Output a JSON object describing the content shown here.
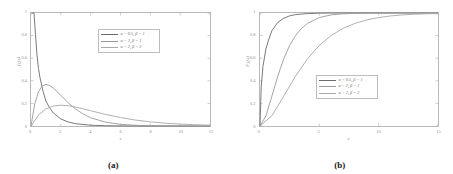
{
  "figure": {
    "panels": [
      {
        "caption": "(a)",
        "ylabel": "f_X(x)",
        "xlabel": "x",
        "legend": [
          {
            "label": "α = 0.5,  β = 1",
            "color": "#6b6b6b"
          },
          {
            "label": "α = 2,  β = 1",
            "color": "#9a9a9a"
          },
          {
            "label": "α = 2,  β = 2",
            "color": "#a8a8a8"
          }
        ]
      },
      {
        "caption": "(b)",
        "ylabel": "F_X(x)",
        "xlabel": "x",
        "legend": [
          {
            "label": "α = 0.5,  β = 1",
            "color": "#6b6b6b"
          },
          {
            "label": "α = 2,  β = 1",
            "color": "#9a9a9a"
          },
          {
            "label": "α = 2,  β = 2",
            "color": "#a8a8a8"
          }
        ]
      }
    ]
  },
  "chart_data": [
    {
      "type": "line",
      "title": "",
      "panel": "(a)",
      "xlabel": "x",
      "ylabel": "f_X(x)",
      "xlim": [
        0,
        12
      ],
      "ylim": [
        0,
        1
      ],
      "xticks": [
        0,
        2,
        4,
        6,
        8,
        10,
        12
      ],
      "xticklabels": [
        "0",
        "2",
        "4",
        "6",
        "8",
        "10",
        "12"
      ],
      "yticks": [
        0,
        0.2,
        0.4,
        0.6,
        0.8,
        1
      ],
      "yticklabels": [
        "0",
        "0.2",
        "0.4",
        "0.6",
        "0.8",
        "1"
      ],
      "grid": false,
      "legend_position": "upper-center",
      "series": [
        {
          "name": "α = 0.5,  β = 1",
          "color": "#6b6b6b",
          "x": [
            0.05,
            0.1,
            0.2,
            0.3,
            0.4,
            0.5,
            0.6,
            0.8,
            1.0,
            1.25,
            1.5,
            2.0,
            2.5,
            3.0,
            4.0,
            5.0,
            6.0,
            8.0,
            10.0,
            12.0
          ],
          "y": [
            2.52,
            1.7,
            1.1,
            0.81,
            0.63,
            0.51,
            0.43,
            0.31,
            0.22,
            0.16,
            0.115,
            0.062,
            0.035,
            0.0202,
            0.0069,
            0.0024,
            0.00089,
            0.00012,
            1.71e-05,
            2.4e-06
          ]
        },
        {
          "name": "α = 2,  β = 1",
          "color": "#9a9a9a",
          "x": [
            0,
            0.25,
            0.5,
            0.75,
            1.0,
            1.25,
            1.5,
            2.0,
            2.5,
            3.0,
            3.5,
            4.0,
            5.0,
            6.0,
            7.0,
            8.0,
            10.0,
            12.0
          ],
          "y": [
            0,
            0.195,
            0.303,
            0.354,
            0.368,
            0.358,
            0.335,
            0.271,
            0.205,
            0.149,
            0.106,
            0.073,
            0.0337,
            0.0149,
            0.0064,
            0.0027,
            0.00045,
            7e-05
          ]
        },
        {
          "name": "α = 2,  β = 2",
          "color": "#a8a8a8",
          "x": [
            0,
            0.5,
            1.0,
            1.5,
            2.0,
            2.5,
            3.0,
            3.5,
            4.0,
            5.0,
            6.0,
            7.0,
            8.0,
            9.0,
            10.0,
            11.0,
            12.0
          ],
          "y": [
            0,
            0.0973,
            0.1516,
            0.1771,
            0.1839,
            0.1791,
            0.1673,
            0.1516,
            0.1353,
            0.1026,
            0.0747,
            0.0527,
            0.0366,
            0.025,
            0.0168,
            0.0112,
            0.0074
          ]
        }
      ]
    },
    {
      "type": "line",
      "title": "",
      "panel": "(b)",
      "xlabel": "x",
      "ylabel": "F_X(x)",
      "xlim": [
        0,
        15
      ],
      "ylim": [
        0,
        1
      ],
      "xticks": [
        0,
        5,
        10,
        15
      ],
      "xticklabels": [
        "0",
        "5",
        "10",
        "15"
      ],
      "yticks": [
        0,
        0.2,
        0.4,
        0.6,
        0.8,
        1
      ],
      "yticklabels": [
        "0",
        "0.2",
        "0.4",
        "0.6",
        "0.8",
        "1"
      ],
      "grid": false,
      "legend_position": "center-right",
      "series": [
        {
          "name": "α = 0.5,  β = 1",
          "color": "#6b6b6b",
          "x": [
            0,
            0.1,
            0.25,
            0.5,
            0.75,
            1.0,
            1.5,
            2.0,
            2.5,
            3.0,
            4.0,
            5.0,
            6.0,
            8.0,
            10.0,
            12.0,
            15.0
          ],
          "y": [
            0,
            0.345,
            0.527,
            0.683,
            0.771,
            0.843,
            0.917,
            0.954,
            0.975,
            0.986,
            0.995,
            0.9984,
            0.9995,
            0.99995,
            1.0,
            1.0,
            1.0
          ]
        },
        {
          "name": "α = 2,  β = 1",
          "color": "#9a9a9a",
          "x": [
            0,
            0.5,
            1.0,
            1.5,
            2.0,
            2.5,
            3.0,
            3.5,
            4.0,
            5.0,
            6.0,
            7.0,
            8.0,
            10.0,
            12.0,
            15.0
          ],
          "y": [
            0,
            0.09,
            0.264,
            0.442,
            0.594,
            0.713,
            0.801,
            0.864,
            0.908,
            0.96,
            0.983,
            0.993,
            0.997,
            0.9995,
            0.99993,
            1.0
          ]
        },
        {
          "name": "α = 2,  β = 2",
          "color": "#a8a8a8",
          "x": [
            0,
            1.0,
            2.0,
            3.0,
            4.0,
            5.0,
            6.0,
            7.0,
            8.0,
            9.0,
            10.0,
            11.0,
            12.0,
            13.0,
            14.0,
            15.0
          ],
          "y": [
            0,
            0.09,
            0.264,
            0.442,
            0.594,
            0.713,
            0.801,
            0.864,
            0.908,
            0.939,
            0.96,
            0.974,
            0.983,
            0.989,
            0.993,
            0.995
          ]
        }
      ]
    }
  ]
}
